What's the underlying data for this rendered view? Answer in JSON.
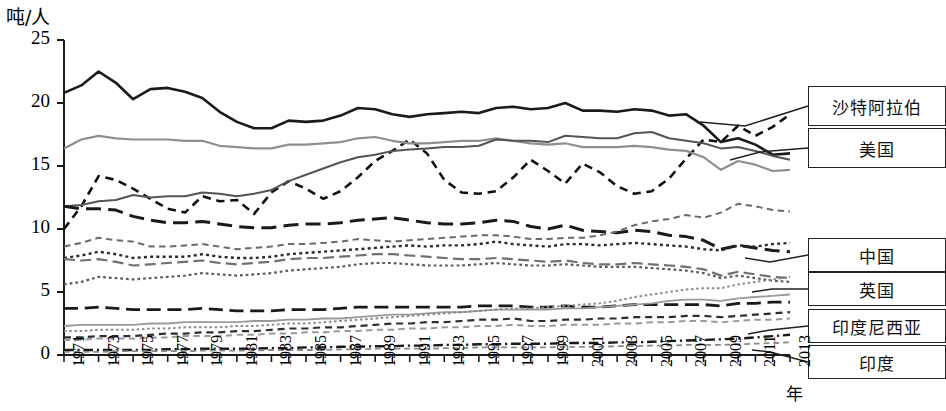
{
  "chart_data": {
    "type": "line",
    "title": "",
    "xlabel": "年",
    "ylabel": "吨/人",
    "ylim": [
      0,
      25
    ],
    "yticks": [
      0,
      5,
      10,
      15,
      20,
      25
    ],
    "xlim": [
      1971,
      2013
    ],
    "grid": false,
    "legend_position": "right",
    "x": [
      1971,
      1972,
      1973,
      1974,
      1975,
      1976,
      1977,
      1978,
      1979,
      1980,
      1981,
      1982,
      1983,
      1984,
      1985,
      1986,
      1987,
      1988,
      1989,
      1990,
      1991,
      1992,
      1993,
      1994,
      1995,
      1996,
      1997,
      1998,
      1999,
      2000,
      2001,
      2002,
      2003,
      2004,
      2005,
      2006,
      2007,
      2008,
      2009,
      2010,
      2011,
      2012,
      2013
    ],
    "xtick_labels": [
      "1971",
      "1973",
      "1975",
      "1977",
      "1979",
      "1981",
      "1983",
      "1985",
      "1987",
      "1989",
      "1991",
      "1993",
      "1995",
      "1997",
      "1999",
      "2001",
      "2003",
      "2005",
      "2007",
      "2009",
      "2011",
      "2013"
    ],
    "series": [
      {
        "name": "美国",
        "style": "solid",
        "color": "#1a1a1a",
        "width": 2.6,
        "values": [
          20.8,
          21.4,
          22.5,
          21.6,
          20.3,
          21.1,
          21.2,
          20.9,
          20.4,
          19.3,
          18.5,
          18.0,
          18.0,
          18.6,
          18.5,
          18.6,
          19.0,
          19.6,
          19.5,
          19.1,
          18.9,
          19.1,
          19.2,
          19.3,
          19.2,
          19.6,
          19.7,
          19.5,
          19.6,
          20.0,
          19.4,
          19.4,
          19.3,
          19.5,
          19.4,
          19.0,
          19.1,
          18.2,
          16.9,
          17.2,
          16.7,
          15.9,
          16.0
        ]
      },
      {
        "name": "沙特阿拉伯",
        "style": "dashed",
        "color": "#111111",
        "width": 2.6,
        "values": [
          10.0,
          11.8,
          14.2,
          13.9,
          13.2,
          12.4,
          11.6,
          11.3,
          12.6,
          12.2,
          12.3,
          11.2,
          12.9,
          13.8,
          13.2,
          12.4,
          13.0,
          14.1,
          15.4,
          16.2,
          17.1,
          16.0,
          13.9,
          12.9,
          12.8,
          13.0,
          14.1,
          15.5,
          14.6,
          13.6,
          15.2,
          14.5,
          13.4,
          12.8,
          13.0,
          14.0,
          15.6,
          17.1,
          16.9,
          18.2,
          17.4,
          18.1,
          19.1
        ]
      },
      {
        "name": "us-gray-upper",
        "style": "solid",
        "color": "#8f8f8f",
        "width": 2.2,
        "values": [
          16.4,
          17.1,
          17.4,
          17.2,
          17.1,
          17.1,
          17.1,
          17.0,
          17.0,
          16.6,
          16.5,
          16.4,
          16.4,
          16.7,
          16.7,
          16.8,
          16.9,
          17.2,
          17.3,
          17.0,
          16.8,
          16.8,
          16.9,
          17.0,
          17.0,
          17.2,
          17.0,
          16.8,
          16.7,
          16.8,
          16.5,
          16.5,
          16.5,
          16.6,
          16.5,
          16.3,
          16.2,
          15.7,
          14.7,
          15.4,
          15.1,
          14.6,
          14.7
        ]
      },
      {
        "name": "mid-gray-rising",
        "style": "solid",
        "color": "#555555",
        "width": 2.0,
        "values": [
          11.8,
          11.9,
          12.2,
          12.3,
          12.7,
          12.5,
          12.6,
          12.6,
          12.9,
          12.8,
          12.6,
          12.8,
          13.1,
          13.8,
          14.3,
          14.8,
          15.3,
          15.7,
          15.9,
          16.2,
          16.3,
          16.4,
          16.5,
          16.5,
          16.6,
          17.1,
          17.0,
          17.0,
          16.9,
          17.4,
          17.3,
          17.2,
          17.2,
          17.6,
          17.7,
          17.2,
          17.0,
          16.8,
          16.4,
          16.5,
          16.2,
          15.8,
          15.5
        ]
      },
      {
        "name": "heavy-dash-declining",
        "style": "longdash",
        "color": "#1a1a1a",
        "width": 3.0,
        "values": [
          11.8,
          11.6,
          11.6,
          11.5,
          11.0,
          10.7,
          10.5,
          10.5,
          10.6,
          10.4,
          10.2,
          10.1,
          10.1,
          10.3,
          10.4,
          10.4,
          10.5,
          10.7,
          10.8,
          10.9,
          10.7,
          10.5,
          10.4,
          10.4,
          10.5,
          10.7,
          10.6,
          10.2,
          10.0,
          10.3,
          9.9,
          9.8,
          9.7,
          9.9,
          9.8,
          9.5,
          9.4,
          9.1,
          8.4,
          8.7,
          8.5,
          8.3,
          8.2
        ]
      },
      {
        "name": "中国",
        "style": "dashed",
        "color": "#6a6a6a",
        "width": 2.0,
        "values": [
          8.6,
          8.9,
          9.3,
          9.1,
          9.0,
          8.6,
          8.6,
          8.7,
          8.8,
          8.6,
          8.4,
          8.5,
          8.6,
          8.8,
          8.8,
          8.9,
          9.0,
          9.2,
          9.1,
          9.0,
          9.1,
          9.2,
          9.3,
          9.4,
          9.5,
          9.5,
          9.4,
          9.2,
          9.2,
          9.3,
          9.3,
          9.5,
          9.8,
          10.3,
          10.6,
          10.8,
          11.1,
          10.9,
          11.3,
          12.0,
          11.8,
          11.5,
          11.4
        ]
      },
      {
        "name": "英国",
        "style": "dotted",
        "color": "#2b2b2b",
        "width": 2.4,
        "values": [
          7.7,
          7.9,
          8.2,
          8.0,
          7.7,
          7.8,
          7.8,
          7.8,
          8.0,
          7.8,
          7.7,
          7.7,
          7.8,
          8.0,
          8.1,
          8.2,
          8.3,
          8.4,
          8.5,
          8.6,
          8.7,
          8.6,
          8.7,
          8.7,
          8.8,
          9.0,
          8.8,
          8.7,
          8.6,
          8.8,
          8.8,
          8.7,
          8.8,
          8.9,
          8.8,
          8.7,
          8.6,
          8.4,
          8.3,
          8.7,
          8.6,
          8.8,
          8.9
        ]
      },
      {
        "name": "mid-dash-gray2",
        "style": "longdash",
        "color": "#707070",
        "width": 2.2,
        "values": [
          7.6,
          7.5,
          7.6,
          7.4,
          7.1,
          7.2,
          7.3,
          7.4,
          7.5,
          7.3,
          7.2,
          7.3,
          7.4,
          7.6,
          7.7,
          7.7,
          7.8,
          7.9,
          8.0,
          8.0,
          7.9,
          7.8,
          7.7,
          7.6,
          7.6,
          7.7,
          7.6,
          7.5,
          7.4,
          7.5,
          7.3,
          7.2,
          7.2,
          7.3,
          7.2,
          7.1,
          7.0,
          6.8,
          6.3,
          6.6,
          6.4,
          6.2,
          6.1
        ]
      },
      {
        "name": "low-dot-gray",
        "style": "dotted",
        "color": "#5a5a5a",
        "width": 2.2,
        "values": [
          5.6,
          5.8,
          6.2,
          6.1,
          6.0,
          6.1,
          6.2,
          6.3,
          6.5,
          6.4,
          6.3,
          6.4,
          6.5,
          6.7,
          6.8,
          6.9,
          7.0,
          7.2,
          7.3,
          7.3,
          7.2,
          7.1,
          7.1,
          7.1,
          7.2,
          7.3,
          7.2,
          7.1,
          7.1,
          7.2,
          7.1,
          7.0,
          7.0,
          7.0,
          6.9,
          6.8,
          6.7,
          6.5,
          6.1,
          6.3,
          6.1,
          5.9,
          5.8
        ]
      },
      {
        "name": "dash-flat-black",
        "style": "longdash",
        "color": "#1a1a1a",
        "width": 2.8,
        "values": [
          3.7,
          3.7,
          3.8,
          3.7,
          3.6,
          3.6,
          3.6,
          3.6,
          3.7,
          3.6,
          3.5,
          3.5,
          3.5,
          3.6,
          3.6,
          3.6,
          3.7,
          3.8,
          3.8,
          3.8,
          3.8,
          3.8,
          3.8,
          3.8,
          3.9,
          3.9,
          3.9,
          3.8,
          3.8,
          3.9,
          3.8,
          3.8,
          3.9,
          4.0,
          4.0,
          4.0,
          4.0,
          4.0,
          3.9,
          4.1,
          4.1,
          4.2,
          4.2
        ]
      },
      {
        "name": "gray-solid-rising",
        "style": "solid",
        "color": "#9a9a9a",
        "width": 1.8,
        "values": [
          2.3,
          2.4,
          2.4,
          2.4,
          2.4,
          2.5,
          2.5,
          2.6,
          2.6,
          2.6,
          2.6,
          2.7,
          2.7,
          2.8,
          2.8,
          2.9,
          2.9,
          3.0,
          3.1,
          3.2,
          3.2,
          3.3,
          3.4,
          3.4,
          3.5,
          3.6,
          3.6,
          3.6,
          3.6,
          3.7,
          3.7,
          3.8,
          3.9,
          4.0,
          4.1,
          4.3,
          4.4,
          4.4,
          4.3,
          4.5,
          4.6,
          4.7,
          4.8
        ]
      },
      {
        "name": "dotted-rising-gray",
        "style": "dotted",
        "color": "#8a8a8a",
        "width": 2.0,
        "values": [
          1.9,
          1.9,
          2.0,
          2.0,
          2.0,
          2.1,
          2.1,
          2.2,
          2.2,
          2.2,
          2.3,
          2.3,
          2.4,
          2.5,
          2.5,
          2.6,
          2.7,
          2.8,
          2.9,
          3.0,
          3.1,
          3.2,
          3.3,
          3.4,
          3.5,
          3.6,
          3.7,
          3.7,
          3.8,
          3.9,
          4.0,
          4.1,
          4.3,
          4.6,
          4.8,
          5.0,
          5.2,
          5.3,
          5.3,
          5.6,
          5.8,
          6.0,
          6.2
        ]
      },
      {
        "name": "印度尼西亚",
        "style": "dashed",
        "color": "#2e2e2e",
        "width": 2.2,
        "values": [
          1.4,
          1.4,
          1.5,
          1.5,
          1.5,
          1.6,
          1.7,
          1.7,
          1.8,
          1.8,
          1.9,
          1.9,
          2.0,
          2.1,
          2.1,
          2.2,
          2.2,
          2.3,
          2.4,
          2.5,
          2.5,
          2.6,
          2.6,
          2.7,
          2.8,
          2.8,
          2.9,
          2.7,
          2.7,
          2.8,
          2.8,
          2.9,
          2.9,
          3.0,
          3.0,
          3.0,
          3.1,
          3.1,
          3.0,
          3.1,
          3.2,
          3.3,
          3.4
        ]
      },
      {
        "name": "low-dash-gray3",
        "style": "dashed",
        "color": "#9a9a9a",
        "width": 2.0,
        "values": [
          1.2,
          1.2,
          1.3,
          1.3,
          1.3,
          1.4,
          1.4,
          1.5,
          1.5,
          1.5,
          1.6,
          1.6,
          1.7,
          1.7,
          1.8,
          1.8,
          1.9,
          1.9,
          2.0,
          2.0,
          2.1,
          2.1,
          2.2,
          2.2,
          2.3,
          2.3,
          2.4,
          2.3,
          2.3,
          2.4,
          2.4,
          2.4,
          2.5,
          2.5,
          2.6,
          2.6,
          2.7,
          2.7,
          2.6,
          2.7,
          2.8,
          2.8,
          2.9
        ]
      },
      {
        "name": "印度",
        "style": "dashdot",
        "color": "#1a1a1a",
        "width": 2.4,
        "values": [
          0.4,
          0.4,
          0.4,
          0.4,
          0.4,
          0.4,
          0.45,
          0.45,
          0.5,
          0.5,
          0.5,
          0.5,
          0.55,
          0.55,
          0.6,
          0.6,
          0.65,
          0.65,
          0.7,
          0.7,
          0.75,
          0.75,
          0.8,
          0.8,
          0.85,
          0.85,
          0.9,
          0.9,
          0.9,
          0.95,
          0.95,
          0.95,
          1.0,
          1.0,
          1.05,
          1.1,
          1.15,
          1.2,
          1.25,
          1.3,
          1.4,
          1.5,
          1.6
        ]
      },
      {
        "name": "bottom-gray-dash",
        "style": "dashed",
        "color": "#8a8a8a",
        "width": 1.8,
        "values": [
          0.25,
          0.25,
          0.25,
          0.3,
          0.3,
          0.3,
          0.3,
          0.3,
          0.35,
          0.35,
          0.35,
          0.35,
          0.4,
          0.4,
          0.4,
          0.4,
          0.45,
          0.45,
          0.5,
          0.5,
          0.5,
          0.5,
          0.55,
          0.55,
          0.6,
          0.6,
          0.6,
          0.6,
          0.6,
          0.65,
          0.65,
          0.65,
          0.7,
          0.7,
          0.75,
          0.75,
          0.8,
          0.8,
          0.8,
          0.85,
          0.9,
          0.95,
          1.0
        ]
      }
    ]
  },
  "legend": {
    "top": [
      {
        "label": "沙特阿拉伯"
      },
      {
        "label": "美国"
      }
    ],
    "bottom": [
      {
        "label": "中国"
      },
      {
        "label": "英国"
      },
      {
        "label": "印度尼西亚"
      },
      {
        "label": "印度"
      }
    ]
  },
  "axis": {
    "y_unit": "吨/人",
    "x_unit": "年"
  }
}
